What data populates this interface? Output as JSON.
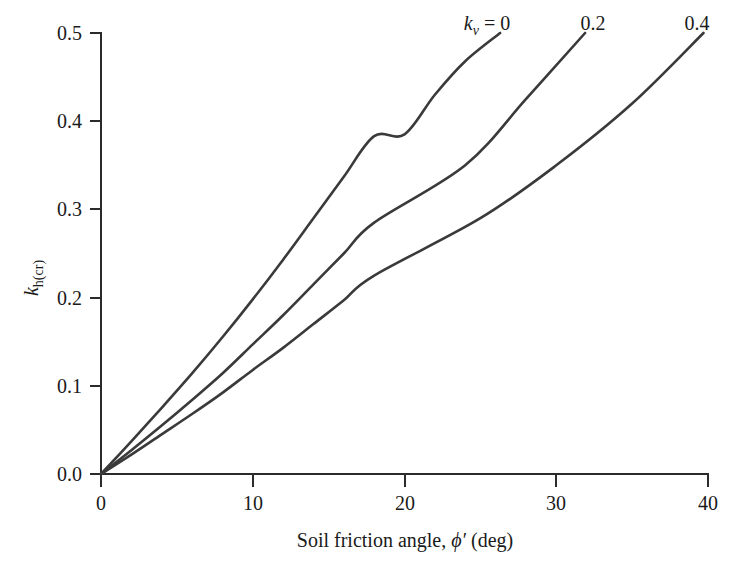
{
  "figure": {
    "background_color": "#ffffff",
    "line_color": "#3a3a3a",
    "axis_color": "#2b2b2b"
  },
  "chart_data": {
    "type": "line",
    "title": "",
    "subtitle": "",
    "xlabel": "Soil friction angle, ϕ′ (deg)",
    "ylabel": "k_h(cr)",
    "xlim": [
      0,
      40
    ],
    "ylim": [
      0.0,
      0.5
    ],
    "xticks": [
      0,
      10,
      20,
      30,
      40
    ],
    "yticks": [
      0.0,
      0.1,
      0.2,
      0.3,
      0.4,
      0.5
    ],
    "xtick_labels": [
      "0",
      "10",
      "20",
      "30",
      "40"
    ],
    "ytick_labels": [
      "0.0",
      "0.1",
      "0.2",
      "0.3",
      "0.4",
      "0.5"
    ],
    "grid": false,
    "legend_position": "inline-curve-end-labels",
    "series": [
      {
        "name": "kv = 0",
        "label": "k_v = 0",
        "x": [
          0,
          2,
          4,
          6,
          8,
          10,
          12,
          14,
          16,
          18,
          20,
          22,
          24,
          26.3
        ],
        "values": [
          0.0,
          0.037,
          0.075,
          0.114,
          0.155,
          0.198,
          0.243,
          0.29,
          0.337,
          0.383,
          0.385,
          0.43,
          0.468,
          0.5
        ]
      },
      {
        "name": "kv = 0.2",
        "label": "0.2",
        "x": [
          0,
          2,
          4,
          6,
          8,
          10,
          12,
          14,
          16,
          18,
          20,
          24,
          28,
          31.9
        ],
        "values": [
          0.0,
          0.027,
          0.055,
          0.084,
          0.114,
          0.147,
          0.18,
          0.215,
          0.25,
          0.285,
          0.271,
          0.35,
          0.425,
          0.5
        ]
      },
      {
        "name": "kv = 0.4",
        "label": "0.4",
        "x": [
          0,
          2,
          4,
          6,
          8,
          10,
          12,
          14,
          16,
          18,
          20,
          25,
          30,
          35,
          39.7
        ],
        "values": [
          0.0,
          0.022,
          0.045,
          0.068,
          0.092,
          0.118,
          0.143,
          0.17,
          0.197,
          0.225,
          0.215,
          0.29,
          0.35,
          0.42,
          0.5
        ]
      }
    ],
    "annotations": [
      {
        "id": "kv-0",
        "text_main": "k",
        "text_sub": "v",
        "text_rest": " = 0",
        "x_px": 487,
        "y_px": 30
      },
      {
        "id": "kv-02",
        "text": "0.2",
        "x_px": 593,
        "y_px": 30
      },
      {
        "id": "kv-04",
        "text": "0.4",
        "x_px": 697,
        "y_px": 30
      }
    ]
  },
  "axis": {
    "y_label_parts": {
      "base": "k",
      "sub": "h(cr)"
    },
    "x_label_parts": {
      "prefix": "Soil friction angle, ",
      "symbol": "ϕ′",
      "suffix": " (deg)"
    }
  }
}
